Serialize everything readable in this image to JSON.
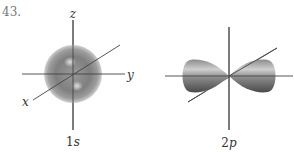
{
  "problem": {
    "number": "43."
  },
  "figures": [
    {
      "id": "orbital-1s",
      "caption_num": "1",
      "caption_sub": "s",
      "axes": {
        "z": "z",
        "y": "y",
        "x": "x"
      }
    },
    {
      "id": "orbital-2p",
      "caption_num": "2",
      "caption_sub": "p"
    }
  ],
  "colors": {
    "axis": "#444444",
    "orbital_dark": "#555555",
    "orbital_mid": "#8a8a8a",
    "orbital_light": "#d8d8d8"
  }
}
